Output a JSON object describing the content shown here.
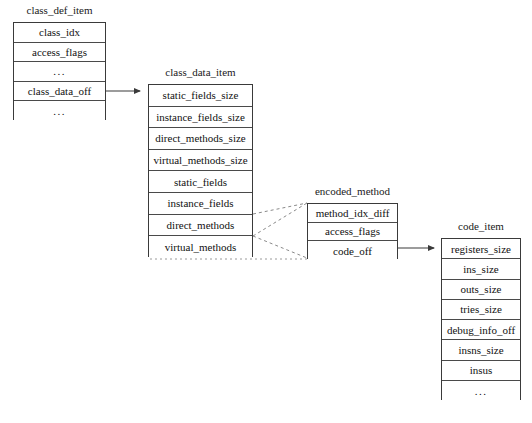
{
  "diagram": {
    "background_color": "#ffffff",
    "line_color": "#4a4a4a",
    "text_color": "#111111"
  },
  "structs": [
    {
      "id": "class_def_item",
      "label": "class_def_item",
      "x": 13,
      "y": 22,
      "width": 93,
      "height": 98,
      "label_y": 4,
      "rows": [
        {
          "text": "class_idx"
        },
        {
          "text": "access_flags"
        },
        {
          "text": "..."
        },
        {
          "text": "class_data_off"
        },
        {
          "text": "..."
        }
      ]
    },
    {
      "id": "class_data_item",
      "label": "class_data_item",
      "x": 148,
      "y": 84,
      "width": 105,
      "height": 173,
      "label_y": 66,
      "rows": [
        {
          "text": "static_fields_size"
        },
        {
          "text": "instance_fields_size"
        },
        {
          "text": "direct_methods_size"
        },
        {
          "text": "virtual_methods_size"
        },
        {
          "text": "static_fields"
        },
        {
          "text": "instance_fields"
        },
        {
          "text": "direct_methods"
        },
        {
          "text": "virtual_methods"
        }
      ]
    },
    {
      "id": "encoded_method",
      "label": "encoded_method",
      "x": 307,
      "y": 203,
      "width": 91,
      "height": 56,
      "label_y": 185,
      "rows": [
        {
          "text": "method_idx_diff"
        },
        {
          "text": "access_flags"
        },
        {
          "text": "code_off"
        }
      ]
    },
    {
      "id": "code_item",
      "label": "code_item",
      "x": 441,
      "y": 238,
      "width": 80,
      "height": 162,
      "label_y": 220,
      "rows": [
        {
          "text": "registers_size"
        },
        {
          "text": "ins_size"
        },
        {
          "text": "outs_size"
        },
        {
          "text": "tries_size"
        },
        {
          "text": "debug_info_off"
        },
        {
          "text": "insns_size"
        },
        {
          "text": "insus"
        },
        {
          "text": "..."
        }
      ]
    }
  ],
  "connectors": [
    {
      "id": "class_data_off-to-class_data_item",
      "kind": "arrow",
      "style": "solid",
      "from": "class_def_item.class_data_off",
      "to": "class_data_item.static_fields_size"
    },
    {
      "id": "direct_methods-to-encoded_method-top",
      "kind": "line",
      "style": "dashed",
      "from": "class_data_item.instance_fields",
      "to": "encoded_method.top"
    },
    {
      "id": "direct_methods-to-encoded_method-fan",
      "kind": "line",
      "style": "dashed",
      "from": "class_data_item.direct_methods",
      "to": "encoded_method.top"
    },
    {
      "id": "direct_methods-to-encoded_method-bottom",
      "kind": "line",
      "style": "dashed",
      "from": "class_data_item.direct_methods",
      "to": "encoded_method.bottom"
    },
    {
      "id": "class_data_item-bottom-to-encoded_method-bottom",
      "kind": "line",
      "style": "dotted",
      "from": "class_data_item.bottom",
      "to": "encoded_method.bottom"
    },
    {
      "id": "code_off-to-code_item",
      "kind": "arrow",
      "style": "solid",
      "from": "encoded_method.code_off",
      "to": "code_item.registers_size"
    }
  ]
}
